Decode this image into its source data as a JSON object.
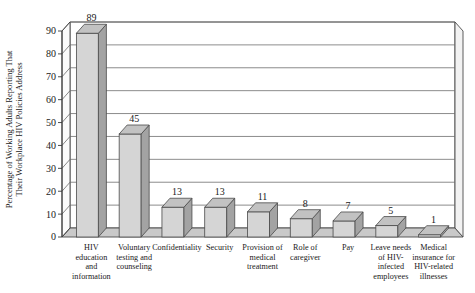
{
  "chart_data": {
    "type": "bar",
    "title": "",
    "subtitle": "",
    "xlabel": "",
    "ylabel": "Percentage of Working Adults Reporting That Their Workplace HIV Policies Address",
    "ylabel_lines": [
      "Percentage of Working Adults Reporting That",
      "Their Workplace HIV Policies Address"
    ],
    "categories": [
      "HIV education and information",
      "Voluntary testing and counseling",
      "Confidentiality",
      "Security",
      "Provision of medical treatment",
      "Role of caregiver",
      "Pay",
      "Leave needs of HIV-infected employees",
      "Medical insurance for HIV-related illnesses"
    ],
    "category_label_lines": [
      [
        "HIV",
        "education",
        "and",
        "information"
      ],
      [
        "Voluntary",
        "testing and",
        "counseling"
      ],
      [
        "Confidentiality"
      ],
      [
        "Security"
      ],
      [
        "Provision of",
        "medical",
        "treatment"
      ],
      [
        "Role of",
        "caregiver"
      ],
      [
        "Pay"
      ],
      [
        "Leave needs",
        "of HIV-",
        "infected",
        "employees"
      ],
      [
        "Medical",
        "insurance for",
        "HIV-related",
        "illnesses"
      ]
    ],
    "values": [
      89,
      45,
      13,
      13,
      11,
      8,
      7,
      5,
      1
    ],
    "value_labels": [
      "89",
      "45",
      "13",
      "13",
      "11",
      "8",
      "7",
      "5",
      "1"
    ],
    "ylim": [
      0,
      90
    ],
    "ytick_values": [
      0,
      10,
      20,
      30,
      40,
      50,
      60,
      70,
      80,
      90
    ],
    "ytick_labels": [
      "0",
      "10",
      "20",
      "30",
      "40",
      "50",
      "60",
      "70",
      "80",
      "90"
    ],
    "grid": true,
    "grid_axis": "y",
    "legend": false,
    "legend_position": "none",
    "perspective_3d": true,
    "colors": {
      "bar_front": "#d5d5d5",
      "bar_side": "#a3a3a3",
      "bar_top": "#c2c2c2",
      "bar_outline": "#4a4a4a",
      "floor": "#c9c9c9",
      "wall": "#ffffff",
      "gridline": "#6e6e6e",
      "axis": "#3a3a3a",
      "text": "#1a1a1a",
      "background": "#ffffff"
    }
  }
}
